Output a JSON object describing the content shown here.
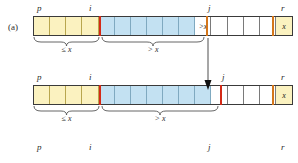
{
  "figure": {
    "part_label": "(a)",
    "type": "quicksort-partition-diagram"
  },
  "colors": {
    "region_le_x": "#fbf2c0",
    "region_gt_x": "#c3e1f2",
    "region_unexamined": "#ffffff",
    "divider_red": "#d42a17",
    "divider_orange": "#d4761a",
    "border": "#3a3a3a",
    "text": "#2b2b2b"
  },
  "rows": [
    {
      "name": "row-before-swap",
      "index_labels": {
        "p": "p",
        "i": "i",
        "j": "j",
        "r": "r"
      },
      "cells": [
        {
          "region": "yellow",
          "text": ""
        },
        {
          "region": "yellow",
          "text": ""
        },
        {
          "region": "yellow",
          "text": ""
        },
        {
          "region": "yellow",
          "text": ""
        },
        {
          "region": "blue",
          "text": ""
        },
        {
          "region": "blue",
          "text": ""
        },
        {
          "region": "blue",
          "text": ""
        },
        {
          "region": "blue",
          "text": ""
        },
        {
          "region": "blue",
          "text": ""
        },
        {
          "region": "blue",
          "text": ""
        },
        {
          "region": "white",
          "text": ">x"
        },
        {
          "region": "white",
          "text": ""
        },
        {
          "region": "white",
          "text": ""
        },
        {
          "region": "white",
          "text": ""
        },
        {
          "region": "white",
          "text": ""
        },
        {
          "region": "pivot",
          "text": "x"
        }
      ],
      "braces": [
        {
          "label": "≤ x"
        },
        {
          "label": "> x"
        }
      ]
    },
    {
      "name": "row-after-swap",
      "index_labels": {
        "p": "p",
        "i": "i",
        "j": "j",
        "r": "r"
      },
      "cells": [
        {
          "region": "yellow",
          "text": ""
        },
        {
          "region": "yellow",
          "text": ""
        },
        {
          "region": "yellow",
          "text": ""
        },
        {
          "region": "yellow",
          "text": ""
        },
        {
          "region": "blue",
          "text": ""
        },
        {
          "region": "blue",
          "text": ""
        },
        {
          "region": "blue",
          "text": ""
        },
        {
          "region": "blue",
          "text": ""
        },
        {
          "region": "blue",
          "text": ""
        },
        {
          "region": "blue",
          "text": ""
        },
        {
          "region": "blue",
          "text": ""
        },
        {
          "region": "white",
          "text": ""
        },
        {
          "region": "white",
          "text": ""
        },
        {
          "region": "white",
          "text": ""
        },
        {
          "region": "white",
          "text": ""
        },
        {
          "region": "pivot",
          "text": "x"
        }
      ],
      "braces": [
        {
          "label": "≤ x"
        },
        {
          "label": "> x"
        }
      ]
    },
    {
      "name": "row-next-partial",
      "index_labels": {
        "p": "p",
        "i": "i",
        "j": "j",
        "r": "r"
      },
      "cells": [],
      "braces": []
    }
  ],
  "annotations": {
    "swap_arrow": "downward-arrow-from-j-to-incremented-i"
  }
}
